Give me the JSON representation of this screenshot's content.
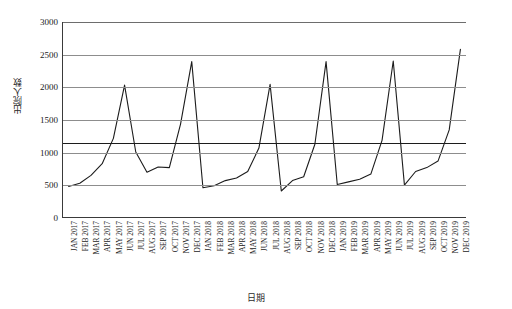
{
  "chart_data": {
    "type": "line",
    "title": "",
    "xlabel": "日期",
    "ylabel": "出院人数",
    "ylim": [
      0,
      3000
    ],
    "ytick_labels": [
      "0",
      "500",
      "1000",
      "1500",
      "2000",
      "2500",
      "3000"
    ],
    "yticks": [
      0,
      500,
      1000,
      1500,
      2000,
      2500,
      3000
    ],
    "grid": "horizontal",
    "legend": "none",
    "categories": [
      "JAN 2017",
      "FEB 2017",
      "MAR 2017",
      "APR 2017",
      "MAY 2017",
      "JUN 2017",
      "JUL 2017",
      "AUG 2017",
      "SEP 2017",
      "OCT 2017",
      "NOV 2017",
      "DEC 2017",
      "JAN 2018",
      "FEB 2018",
      "MAR 2018",
      "APR 2018",
      "MAY 2018",
      "JUN 2018",
      "JUL 2018",
      "AUG 2018",
      "SEP 2018",
      "OCT 2018",
      "NOV 2018",
      "DEC 2018",
      "JAN 2019",
      "FEB 2019",
      "MAR 2019",
      "APR 2019",
      "MAY 2019",
      "JUN 2019",
      "JUL 2019",
      "AUG 2019",
      "SEP 2019",
      "OCT 2019",
      "NOV 2019",
      "DEC 2019"
    ],
    "values": [
      470,
      520,
      640,
      820,
      1210,
      2030,
      1000,
      690,
      770,
      760,
      1430,
      2390,
      450,
      480,
      560,
      600,
      700,
      1060,
      2040,
      400,
      560,
      620,
      1120,
      2390,
      500,
      540,
      580,
      660,
      1180,
      2400,
      490,
      700,
      760,
      860,
      1340,
      2580
    ],
    "reference_line": 1150,
    "line_color": "#1c1c1c",
    "gridline_color": "#8d8d8d",
    "axis_color": "#3a3a3a"
  }
}
